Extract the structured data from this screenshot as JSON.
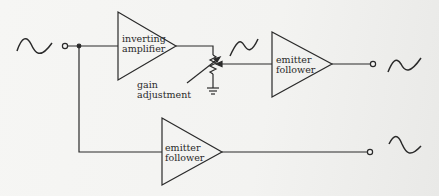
{
  "diagram": {
    "blocks": [
      {
        "id": "inverting-amplifier",
        "line1": "inverting",
        "line2": "amplifier"
      },
      {
        "id": "emitter-follower-top",
        "line1": "emitter",
        "line2": "follower"
      },
      {
        "id": "emitter-follower-bottom",
        "line1": "emitter",
        "line2": "follower"
      }
    ],
    "annotations": {
      "gain_line1": "gain",
      "gain_line2": "adjustment"
    },
    "colors": {
      "ink": "#2a2a2a",
      "paper": "#f4f4f2"
    }
  }
}
